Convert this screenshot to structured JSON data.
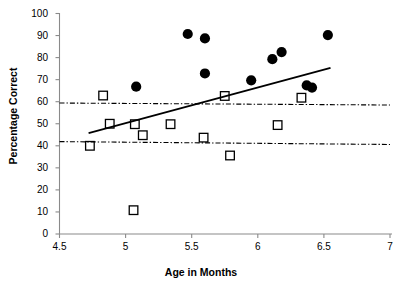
{
  "chart_data": {
    "type": "scatter",
    "title": "",
    "xlabel": "Age in Months",
    "ylabel": "Percentage Correct",
    "xlim": [
      4.5,
      7
    ],
    "ylim": [
      0,
      100
    ],
    "xticks": [
      "4.5",
      "5",
      "5.5",
      "6",
      "6.5",
      "7"
    ],
    "xtick_values": [
      4.5,
      5,
      5.5,
      6,
      6.5,
      7
    ],
    "yticks": [
      "0",
      "10",
      "20",
      "30",
      "40",
      "50",
      "60",
      "70",
      "80",
      "90",
      "100"
    ],
    "ytick_values": [
      0,
      10,
      20,
      30,
      40,
      50,
      60,
      70,
      80,
      90,
      100
    ],
    "grid": false,
    "legend": "none",
    "series": [
      {
        "name": "Filled circles",
        "marker": "filled-circle",
        "color": "#000000",
        "points": [
          {
            "x": 5.08,
            "y": 66.8
          },
          {
            "x": 5.47,
            "y": 90.7
          },
          {
            "x": 5.6,
            "y": 88.7
          },
          {
            "x": 5.6,
            "y": 72.8
          },
          {
            "x": 5.95,
            "y": 69.7
          },
          {
            "x": 6.11,
            "y": 79.3
          },
          {
            "x": 6.18,
            "y": 82.5
          },
          {
            "x": 6.37,
            "y": 67.4
          },
          {
            "x": 6.41,
            "y": 66.4
          },
          {
            "x": 6.53,
            "y": 90.2
          }
        ]
      },
      {
        "name": "Open squares",
        "marker": "open-square",
        "color": "#000000",
        "points": [
          {
            "x": 4.73,
            "y": 40.0
          },
          {
            "x": 4.83,
            "y": 62.8
          },
          {
            "x": 4.88,
            "y": 50.0
          },
          {
            "x": 5.06,
            "y": 10.8
          },
          {
            "x": 5.07,
            "y": 49.8
          },
          {
            "x": 5.13,
            "y": 44.8
          },
          {
            "x": 5.34,
            "y": 49.8
          },
          {
            "x": 5.59,
            "y": 43.7
          },
          {
            "x": 5.75,
            "y": 62.6
          },
          {
            "x": 5.79,
            "y": 35.6
          },
          {
            "x": 6.15,
            "y": 49.4
          },
          {
            "x": 6.33,
            "y": 61.8
          }
        ]
      }
    ],
    "lines": [
      {
        "name": "regression-trendline",
        "style": "solid",
        "color": "#000000",
        "width": 1.8,
        "from": {
          "x": 4.72,
          "y": 45.8
        },
        "to": {
          "x": 6.55,
          "y": 75.3
        }
      },
      {
        "name": "upper-reference-line",
        "style": "dash-dot",
        "color": "#000000",
        "width": 1.1,
        "from": {
          "x": 4.5,
          "y": 59.4
        },
        "to": {
          "x": 7.0,
          "y": 58.5
        }
      },
      {
        "name": "lower-reference-line",
        "style": "dash-dot",
        "color": "#000000",
        "width": 1.1,
        "from": {
          "x": 4.5,
          "y": 41.9
        },
        "to": {
          "x": 7.0,
          "y": 40.6
        }
      }
    ]
  }
}
